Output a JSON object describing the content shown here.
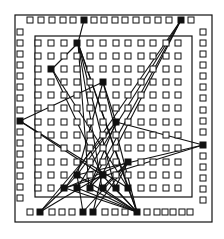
{
  "diagram": {
    "type": "chip-placement-wiring",
    "colors": {
      "ink": "#111111",
      "background": "#ffffff"
    },
    "outer_frame": {
      "x": 15,
      "y": 15,
      "w": 197,
      "h": 207
    },
    "inner_frame": {
      "x": 35,
      "y": 36,
      "w": 157,
      "h": 161
    },
    "pad_size": 6,
    "io_pads": {
      "top": {
        "y": 20,
        "xs": [
          30,
          41,
          52,
          63,
          73,
          84,
          94,
          104,
          115,
          125,
          136,
          147,
          158,
          169,
          181,
          191
        ],
        "filled": [
          84,
          181
        ]
      },
      "left": {
        "x": 20,
        "ys": [
          32,
          43,
          54,
          65,
          76,
          87,
          98,
          110,
          121,
          132,
          143,
          154,
          165,
          176,
          187,
          198
        ],
        "filled": [
          121
        ]
      },
      "right": {
        "x": 203,
        "ys": [
          32,
          43,
          54,
          65,
          76,
          87,
          98,
          110,
          121,
          132,
          145,
          156,
          167,
          178,
          189,
          200
        ],
        "filled": [
          145
        ]
      },
      "bottom": {
        "y": 212,
        "xs": [
          30,
          40,
          52,
          62,
          72,
          83,
          93,
          105,
          115,
          125,
          137,
          147,
          157,
          165,
          173,
          182,
          190
        ],
        "filled": [
          40,
          83,
          93,
          137
        ]
      }
    },
    "core_grid": {
      "cols": [
        38,
        51,
        64,
        77,
        90,
        103,
        116,
        128,
        141,
        153,
        166,
        178
      ],
      "rows": [
        43,
        56,
        69,
        82,
        95,
        108,
        122,
        135,
        148,
        162,
        175,
        188
      ],
      "filled": [
        [
          78,
          43
        ],
        [
          52,
          69
        ],
        [
          103,
          82
        ],
        [
          116,
          122
        ],
        [
          128,
          162
        ],
        [
          77,
          175
        ],
        [
          102,
          175
        ],
        [
          65,
          188
        ],
        [
          77,
          188
        ],
        [
          89,
          188
        ],
        [
          102,
          188
        ],
        [
          115,
          188
        ],
        [
          128,
          188
        ]
      ]
    },
    "wires": [
      [
        84,
        20,
        78,
        43
      ],
      [
        78,
        43,
        52,
        69
      ],
      [
        78,
        43,
        89,
        188
      ],
      [
        78,
        43,
        102,
        188
      ],
      [
        78,
        43,
        115,
        188
      ],
      [
        78,
        43,
        137,
        212
      ],
      [
        78,
        43,
        128,
        188
      ],
      [
        52,
        69,
        102,
        175
      ],
      [
        52,
        69,
        128,
        188
      ],
      [
        181,
        20,
        65,
        188
      ],
      [
        181,
        20,
        77,
        188
      ],
      [
        181,
        20,
        89,
        188
      ],
      [
        181,
        20,
        102,
        175
      ],
      [
        20,
        121,
        103,
        82
      ],
      [
        20,
        121,
        102,
        175
      ],
      [
        20,
        121,
        128,
        188
      ],
      [
        103,
        82,
        116,
        122
      ],
      [
        103,
        82,
        77,
        175
      ],
      [
        103,
        82,
        137,
        212
      ],
      [
        203,
        145,
        116,
        122
      ],
      [
        203,
        145,
        77,
        175
      ],
      [
        203,
        145,
        65,
        188
      ],
      [
        116,
        122,
        40,
        212
      ],
      [
        116,
        122,
        89,
        188
      ],
      [
        116,
        122,
        77,
        175
      ],
      [
        128,
        162,
        65,
        188
      ],
      [
        128,
        162,
        102,
        188
      ],
      [
        128,
        162,
        83,
        212
      ],
      [
        40,
        212,
        65,
        188
      ],
      [
        40,
        212,
        102,
        175
      ],
      [
        77,
        175,
        137,
        212
      ],
      [
        102,
        175,
        137,
        212
      ],
      [
        65,
        188,
        137,
        212
      ],
      [
        77,
        188,
        137,
        212
      ],
      [
        89,
        188,
        137,
        212
      ],
      [
        102,
        188,
        137,
        212
      ],
      [
        115,
        188,
        137,
        212
      ],
      [
        128,
        188,
        137,
        212
      ],
      [
        83,
        212,
        77,
        175
      ],
      [
        93,
        212,
        102,
        175
      ],
      [
        93,
        212,
        128,
        162
      ],
      [
        65,
        188,
        77,
        175
      ],
      [
        89,
        188,
        102,
        175
      ],
      [
        115,
        188,
        128,
        162
      ]
    ]
  }
}
